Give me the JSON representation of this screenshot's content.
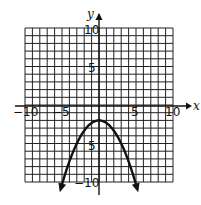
{
  "chart_data": {
    "type": "line",
    "title": "",
    "xlabel": "x",
    "ylabel": "y",
    "xlim": [
      -10,
      10
    ],
    "ylim": [
      -10,
      10
    ],
    "grid": true,
    "grid_step": 1,
    "x_tick_labels": [
      "-10",
      "-5",
      "5",
      "10"
    ],
    "y_tick_labels": [
      "10",
      "5",
      "-5",
      "-10"
    ],
    "series": [
      {
        "name": "parabola",
        "equation_approx": "y = -x^2/3 - 2",
        "vertex": [
          0,
          -2
        ],
        "opens": "down",
        "arrows_both_ends": true,
        "x": [
          -5.2,
          -4,
          -3,
          -2,
          -1,
          0,
          1,
          2,
          3,
          4,
          5.2
        ],
        "y": [
          -11,
          -7.3,
          -5,
          -3.3,
          -2.3,
          -2,
          -2.3,
          -3.3,
          -5,
          -7.3,
          -11
        ]
      }
    ],
    "legend": null
  },
  "labels": {
    "x_axis": "x",
    "y_axis": "y",
    "x_neg10": "−10",
    "x_neg5": "−5",
    "x_pos5": "5",
    "x_pos10": "10",
    "y_pos10": "10",
    "y_pos5": "5",
    "y_neg5": "5",
    "y_neg10": "−10"
  }
}
